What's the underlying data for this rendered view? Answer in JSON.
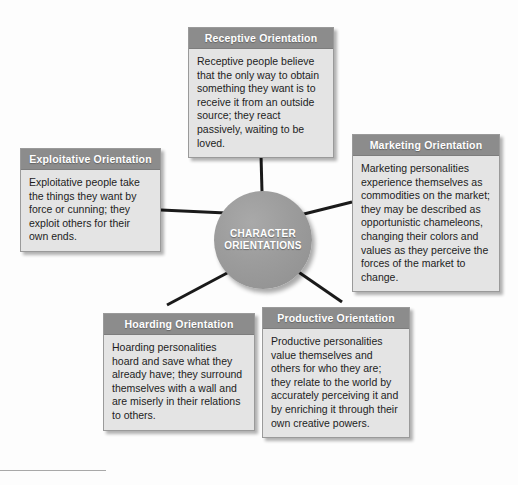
{
  "hub": {
    "label": "CHARACTER\nORIENTATIONS"
  },
  "boxes": [
    {
      "id": "receptive",
      "title": "Receptive Orientation",
      "body": "Receptive people believe that the only way to obtain something they want is to receive it from an outside source; they react passively, waiting to be loved."
    },
    {
      "id": "exploitative",
      "title": "Exploitative Orientation",
      "body": "Exploitative people take the things they want by force or cunning; they exploit others for their own ends."
    },
    {
      "id": "marketing",
      "title": "Marketing Orientation",
      "body": "Marketing personalities experience themselves as commodities on the market; they may be described as opportunistic chameleons, changing their colors and values as they perceive the forces of the market to change."
    },
    {
      "id": "hoarding",
      "title": "Hoarding Orientation",
      "body": "Hoarding personalities hoard and save what they already have; they surround themselves with a wall and are miserly in their relations to others."
    },
    {
      "id": "productive",
      "title": "Productive Orientation",
      "body": "Productive personalities value themselves and others for who they are; they relate to the world by accurately perceiving it and by enriching it through their own creative powers."
    }
  ],
  "colors": {
    "header_fill": "#8c8c8c",
    "body_fill": "#e4e4e4",
    "hub_fill": "#9c9c9c",
    "connector": "#1a1a1a",
    "text": "#1d1d1d",
    "header_text": "#ffffff"
  }
}
